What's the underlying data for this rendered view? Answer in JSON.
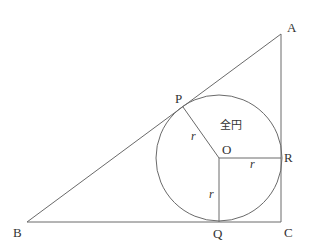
{
  "diagram": {
    "type": "geometry",
    "colors": {
      "stroke": "#6a6a6a",
      "text": "#333333",
      "background": "#ffffff"
    },
    "vertices": {
      "A": "A",
      "B": "B",
      "C": "C"
    },
    "tangent_points": {
      "P": "P",
      "Q": "Q",
      "R": "R"
    },
    "center": "O",
    "radius_labels": {
      "OP": "r",
      "OQ": "r",
      "OR": "r"
    },
    "circle_label": "全円"
  }
}
